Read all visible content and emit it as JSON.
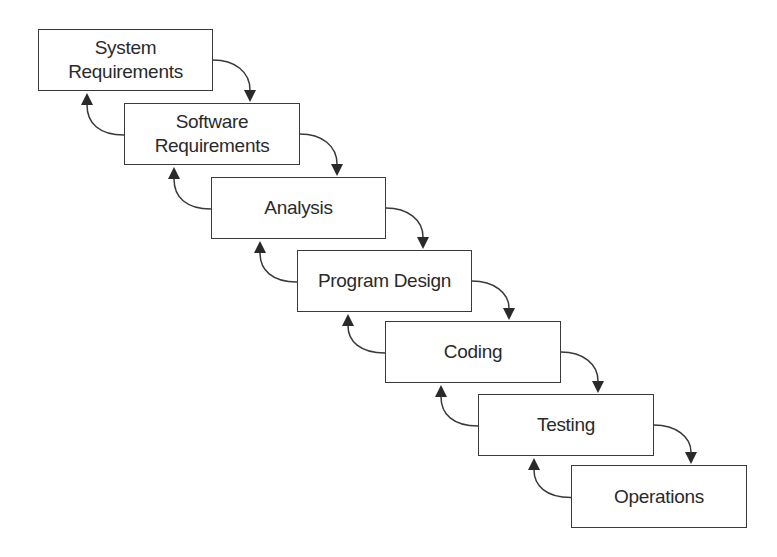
{
  "diagram": {
    "type": "waterfall-model",
    "colors": {
      "stroke": "#3a3a3a",
      "text": "#2a2a2a",
      "background": "#ffffff"
    },
    "stages": [
      {
        "id": "system-requirements",
        "label": "System\nRequirements",
        "x": 38,
        "y": 29,
        "w": 175,
        "h": 62
      },
      {
        "id": "software-requirements",
        "label": "Software\nRequirements",
        "x": 124,
        "y": 103,
        "w": 176,
        "h": 62
      },
      {
        "id": "analysis",
        "label": "Analysis",
        "x": 211,
        "y": 177,
        "w": 175,
        "h": 62
      },
      {
        "id": "program-design",
        "label": "Program Design",
        "x": 297,
        "y": 250,
        "w": 175,
        "h": 62
      },
      {
        "id": "coding",
        "label": "Coding",
        "x": 385,
        "y": 321,
        "w": 176,
        "h": 62
      },
      {
        "id": "testing",
        "label": "Testing",
        "x": 478,
        "y": 394,
        "w": 176,
        "h": 62
      },
      {
        "id": "operations",
        "label": "Operations",
        "x": 571,
        "y": 465,
        "w": 176,
        "h": 63
      }
    ],
    "forward_arrows": [
      {
        "from": "system-requirements",
        "to": "software-requirements"
      },
      {
        "from": "software-requirements",
        "to": "analysis"
      },
      {
        "from": "analysis",
        "to": "program-design"
      },
      {
        "from": "program-design",
        "to": "coding"
      },
      {
        "from": "coding",
        "to": "testing"
      },
      {
        "from": "testing",
        "to": "operations"
      }
    ],
    "back_arrows": [
      {
        "from": "software-requirements",
        "to": "system-requirements"
      },
      {
        "from": "analysis",
        "to": "software-requirements"
      },
      {
        "from": "program-design",
        "to": "analysis"
      },
      {
        "from": "coding",
        "to": "program-design"
      },
      {
        "from": "testing",
        "to": "coding"
      },
      {
        "from": "operations",
        "to": "testing"
      }
    ]
  }
}
